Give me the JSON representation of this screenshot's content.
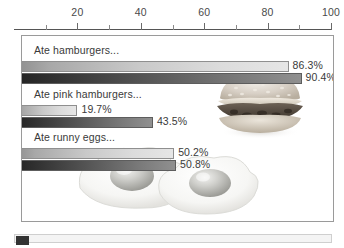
{
  "chart_data": {
    "type": "bar",
    "orientation": "horizontal",
    "title": "",
    "xlabel": "",
    "ylabel": "",
    "xlim": [
      0,
      100
    ],
    "xticks": [
      20,
      40,
      60,
      80,
      100
    ],
    "xtick_labels": [
      "20",
      "40",
      "60",
      "80",
      "100"
    ],
    "minor_ticks": [
      10,
      30,
      50,
      70,
      90
    ],
    "grid": false,
    "axis_position": "top",
    "legend_position": "bottom-left",
    "value_suffix": "%",
    "categories": [
      "Ate hamburgers...",
      "Ate pink hamburgers...",
      "Ate runny eggs..."
    ],
    "series": [
      {
        "name": "General public",
        "color": "#c9c9c9",
        "values": [
          86.3,
          19.7,
          50.2
        ],
        "value_labels": [
          "86.3%",
          "19.7%",
          "50.2%"
        ]
      },
      {
        "name": "Student sample",
        "color": "#4e4e4e",
        "values": [
          90.4,
          43.5,
          50.8
        ],
        "value_labels": [
          "90.4%",
          "43.5%",
          "50.8%"
        ]
      }
    ]
  },
  "legend": {
    "items": [
      {
        "label": "General public",
        "swatch": "light"
      },
      {
        "label": "Student sample",
        "swatch": "dark"
      }
    ]
  },
  "background_art": [
    {
      "name": "hamburger-photo"
    },
    {
      "name": "fried-eggs-photo"
    }
  ]
}
